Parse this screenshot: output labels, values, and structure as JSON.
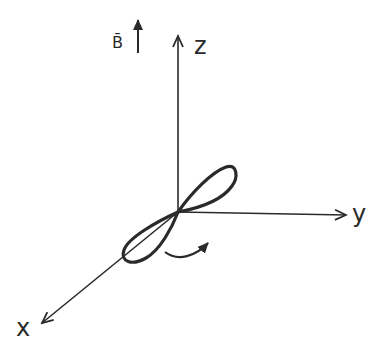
{
  "diagram": {
    "type": "3d-coordinate-axes",
    "labels": {
      "x": "x",
      "y": "y",
      "z": "z",
      "field": "B̄"
    },
    "colors": {
      "stroke": "#2a2a2a",
      "background": "#ffffff"
    },
    "elements": [
      {
        "name": "z-axis",
        "description": "vertical axis arrow up"
      },
      {
        "name": "y-axis",
        "description": "horizontal axis arrow right"
      },
      {
        "name": "x-axis",
        "description": "diagonal axis arrow down-left"
      },
      {
        "name": "field-arrow",
        "description": "magnetic field B arrow pointing up"
      },
      {
        "name": "orbital-lobes",
        "description": "figure-eight p-orbital shape along diagonal"
      },
      {
        "name": "rotation-arrow",
        "description": "curved arrow indicating rotation about z"
      }
    ]
  }
}
